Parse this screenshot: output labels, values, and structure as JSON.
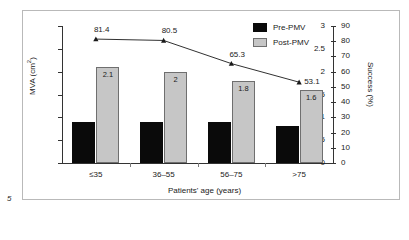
{
  "figure": {
    "number_label": "5",
    "frame_visible": true
  },
  "chart_data": {
    "type": "bar",
    "title": "",
    "xlabel": "Patients' age (years)",
    "ylabel": "MVA (cm2)",
    "ylabel_display": "MVA (cm²)",
    "y2label": "Success (%)",
    "categories": [
      "≤35",
      "36–55",
      "56–75",
      ">75"
    ],
    "ylim": [
      0,
      3
    ],
    "yticks": [
      "0",
      "0.5",
      "1",
      "1.5",
      "2",
      "2.5",
      "3"
    ],
    "ytick_values": [
      0,
      0.5,
      1,
      1.5,
      2,
      2.5,
      3
    ],
    "y2lim": [
      0,
      90
    ],
    "y2ticks": [
      "0",
      "10",
      "20",
      "30",
      "40",
      "50",
      "60",
      "70",
      "80",
      "90"
    ],
    "y2tick_values": [
      0,
      10,
      20,
      30,
      40,
      50,
      60,
      70,
      80,
      90
    ],
    "grid": false,
    "legend_position": "top-right",
    "series": [
      {
        "name": "Pre-PMV",
        "type": "bar",
        "axis": "left",
        "color": "#0a0a0a",
        "values": [
          0.9,
          0.9,
          0.9,
          0.8
        ],
        "labels": [
          "",
          "",
          "",
          ""
        ]
      },
      {
        "name": "Post-PMV",
        "type": "bar",
        "axis": "left",
        "color": "#c6c6c6",
        "values": [
          2.1,
          2.0,
          1.8,
          1.6
        ],
        "labels": [
          "2.1",
          "2",
          "1.8",
          "1.6"
        ]
      },
      {
        "name": "Success",
        "type": "line",
        "axis": "right",
        "color": "#1a1a1a",
        "marker": "triangle",
        "values": [
          81.4,
          80.5,
          65.3,
          53.1
        ],
        "labels": [
          "81.4",
          "80.5",
          "65.3",
          "53.1"
        ]
      }
    ]
  },
  "legend": {
    "items": [
      {
        "label": "Pre-PMV",
        "swatch": "pre"
      },
      {
        "label": "Post-PMV",
        "swatch": "post"
      }
    ]
  }
}
